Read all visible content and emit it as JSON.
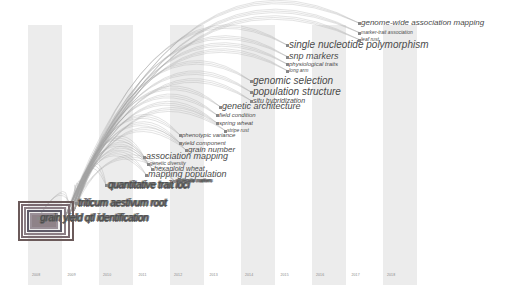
{
  "view": {
    "type": "timezone-timeline",
    "background": "#ffffff",
    "stripe_color": "#ececec",
    "label_color": "#4a4a4a",
    "link_color": "#a0a0a0"
  },
  "timeline": {
    "years": [
      "2008",
      "2009",
      "2010",
      "2011",
      "2012",
      "2013",
      "2014",
      "2015",
      "2016",
      "2017",
      "2018"
    ]
  },
  "keywords": [
    {
      "label": "genome-wide association mapping",
      "x": 361,
      "y": 19,
      "size": 8
    },
    {
      "label": "marker-trait association",
      "x": 361,
      "y": 30,
      "size": 5
    },
    {
      "label": "leaf rust",
      "x": 361,
      "y": 37,
      "size": 5
    },
    {
      "label": "single nucleotide polymorphism",
      "x": 289,
      "y": 40,
      "size": 10
    },
    {
      "label": "snp markers",
      "x": 289,
      "y": 52,
      "size": 9
    },
    {
      "label": "physiological traits",
      "x": 289,
      "y": 61,
      "size": 6
    },
    {
      "label": "long arm",
      "x": 289,
      "y": 68,
      "size": 5
    },
    {
      "label": "genomic selection",
      "x": 253,
      "y": 76,
      "size": 10
    },
    {
      "label": "population structure",
      "x": 253,
      "y": 87,
      "size": 10
    },
    {
      "label": "situ hybridization",
      "x": 253,
      "y": 97,
      "size": 7
    },
    {
      "label": "genetic architecture",
      "x": 222,
      "y": 102,
      "size": 9
    },
    {
      "label": "field condition",
      "x": 219,
      "y": 112,
      "size": 6
    },
    {
      "label": "spring wheat",
      "x": 219,
      "y": 120,
      "size": 6
    },
    {
      "label": "stripe rust",
      "x": 227,
      "y": 128,
      "size": 5
    },
    {
      "label": "phenotypic variance",
      "x": 182,
      "y": 132,
      "size": 6
    },
    {
      "label": "yield component",
      "x": 182,
      "y": 140,
      "size": 6
    },
    {
      "label": "grain number",
      "x": 188,
      "y": 146,
      "size": 8
    },
    {
      "label": "association mapping",
      "x": 146,
      "y": 152,
      "size": 9
    },
    {
      "label": "genetic diversity",
      "x": 150,
      "y": 161,
      "size": 5
    },
    {
      "label": "hexaploid wheat",
      "x": 154,
      "y": 165,
      "size": 7
    },
    {
      "label": "mapping population",
      "x": 148,
      "y": 170,
      "size": 9
    },
    {
      "label": "quantitative trait loci",
      "x": 108,
      "y": 180,
      "size": 10
    },
    {
      "label": "molecular markers",
      "x": 176,
      "y": 178,
      "size": 5
    },
    {
      "label": "triticum aestivum root",
      "x": 78,
      "y": 198,
      "size": 10
    },
    {
      "label": "grain yield qtl identification",
      "x": 40,
      "y": 213,
      "size": 10
    }
  ],
  "hub_node": {
    "x": 18,
    "y": 201,
    "w": 56,
    "h": 40,
    "ring_colors": [
      "#6b5a5a",
      "#7a6a70",
      "#8c7f86",
      "#5e5a68",
      "#9a9098"
    ]
  },
  "chart_data": {
    "type": "timeline",
    "title": "",
    "xlabel": "",
    "ylabel": "",
    "x_ticks": [
      "2008",
      "2009",
      "2010",
      "2011",
      "2012",
      "2013",
      "2014",
      "2015",
      "2016",
      "2017",
      "2018"
    ],
    "nodes": [
      {
        "keyword": "grain yield",
        "year": 2008
      },
      {
        "keyword": "qtl",
        "year": 2008
      },
      {
        "keyword": "triticum aestivum",
        "year": 2009
      },
      {
        "keyword": "quantitative trait loci",
        "year": 2009
      },
      {
        "keyword": "mapping population",
        "year": 2010
      },
      {
        "keyword": "hexaploid wheat",
        "year": 2010
      },
      {
        "keyword": "association mapping",
        "year": 2010
      },
      {
        "keyword": "grain number",
        "year": 2011
      },
      {
        "keyword": "yield component",
        "year": 2011
      },
      {
        "keyword": "phenotypic variance",
        "year": 2011
      },
      {
        "keyword": "stripe rust",
        "year": 2012
      },
      {
        "keyword": "spring wheat",
        "year": 2012
      },
      {
        "keyword": "field condition",
        "year": 2012
      },
      {
        "keyword": "genetic architecture",
        "year": 2012
      },
      {
        "keyword": "situ hybridization",
        "year": 2013
      },
      {
        "keyword": "population structure",
        "year": 2013
      },
      {
        "keyword": "genomic selection",
        "year": 2013
      },
      {
        "keyword": "long arm",
        "year": 2014
      },
      {
        "keyword": "physiological traits",
        "year": 2014
      },
      {
        "keyword": "snp markers",
        "year": 2014
      },
      {
        "keyword": "single nucleotide polymorphism",
        "year": 2014
      },
      {
        "keyword": "leaf rust",
        "year": 2015
      },
      {
        "keyword": "marker-trait association",
        "year": 2015
      },
      {
        "keyword": "genome-wide association mapping",
        "year": 2015
      }
    ],
    "grid": false,
    "legend": "none"
  }
}
